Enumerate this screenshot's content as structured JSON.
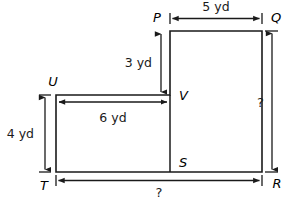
{
  "figure": {
    "unit": "yd",
    "vertices": {
      "P": "P",
      "Q": "Q",
      "R": "R",
      "S": "S",
      "T": "T",
      "U": "U",
      "V": "V"
    },
    "dimensions": {
      "pq_top": "5 yd",
      "pv_left_of_upper": "3 yd",
      "uv_width": "6 yd",
      "ut_height": "4 yd",
      "qr_right": "?",
      "tr_bottom": "?"
    },
    "colors": {
      "stroke": "#1a1a1a",
      "background": "#ffffff"
    }
  }
}
